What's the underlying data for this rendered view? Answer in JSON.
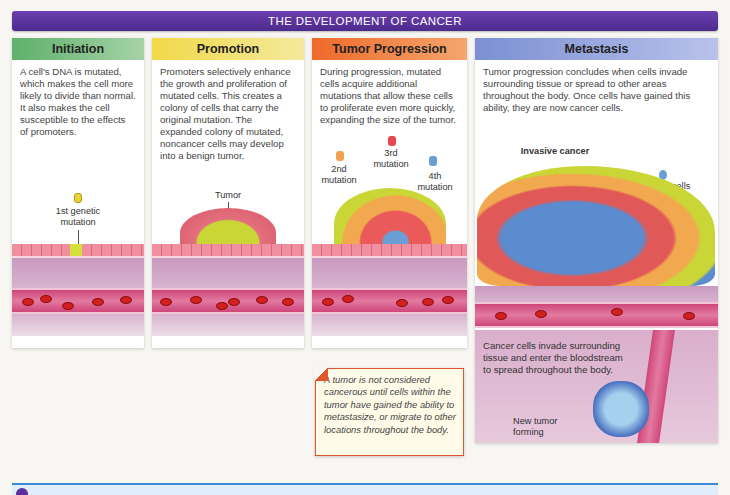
{
  "title": "THE DEVELOPMENT OF CANCER",
  "panels": [
    {
      "heading": "Initiation",
      "text": "A cell's DNA is mutated, which makes the cell more likely to divide than normal. It also makes the cell susceptible to the effects of promoters.",
      "labels": [
        "1st genetic mutation"
      ],
      "color": "#5fb06a"
    },
    {
      "heading": "Promotion",
      "text": "Promoters selectively enhance the growth and proliferation of mutated cells. This creates a colony of cells that carry the original mutation. The expanded colony of mutated, noncancer cells may develop into a benign tumor.",
      "labels": [
        "Tumor"
      ],
      "color": "#f1d94a"
    },
    {
      "heading": "Tumor Progression",
      "text": "During progression, mutated cells acquire additional mutations that allow these cells to proliferate even more quickly, expanding the size of the tumor.",
      "labels": [
        "2nd mutation",
        "3rd mutation",
        "4th mutation"
      ],
      "color": "#ee6a2a"
    },
    {
      "heading": "Metastasis",
      "text": "Tumor progression concludes when cells invade surrounding tissue or spread to other areas throughout the body. Once cells have gained this ability, they are now cancer cells.",
      "labels": [
        "Invasive cancer",
        "Cancer cells",
        "Cancer cells invade surrounding tissue and enter the bloodstream to spread throughout the body.",
        "New tumor forming"
      ],
      "color": "#7b8fd2"
    }
  ],
  "callout": {
    "text": "A tumor is not considered cancerous until cells within the tumor have gained the ability to metastasize, or migrate to other locations throughout the body."
  },
  "colors": {
    "title_bar": "#5a33a0",
    "footer_border": "#3d8ad6",
    "callout_border": "#e2552a"
  }
}
